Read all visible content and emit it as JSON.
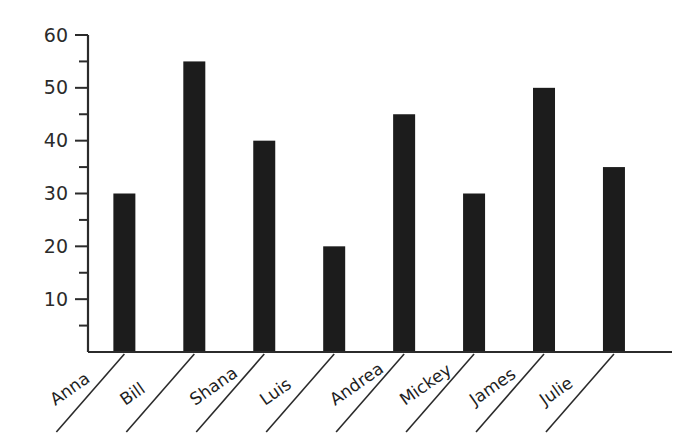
{
  "chart_data": {
    "type": "bar",
    "title": "",
    "subtitle": "",
    "xlabel": "",
    "ylabel": "",
    "categories": [
      "Anna",
      "Bill",
      "Shana",
      "Luis",
      "Andrea",
      "Mickey",
      "James",
      "Julie"
    ],
    "values": [
      30,
      55,
      40,
      20,
      45,
      30,
      50,
      35
    ],
    "ylim": [
      0,
      60
    ],
    "y_major_ticks": [
      10,
      20,
      30,
      40,
      50,
      60
    ],
    "y_tick_labels": [
      "10",
      "20",
      "30",
      "40",
      "50",
      "60"
    ],
    "y_minor_ticks": [
      5,
      15,
      25,
      35,
      45,
      55
    ],
    "grid": false,
    "legend": false,
    "legend_position": "none",
    "orientation": "vertical",
    "bar_color": "#1c1c1c",
    "axis_color": "#2b2b2b",
    "background_color": "#ffffff",
    "category_label_rotation": -35,
    "category_labels_have_leader_lines": true
  }
}
